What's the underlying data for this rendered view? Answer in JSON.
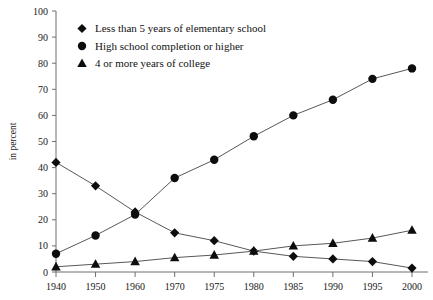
{
  "chart_data": {
    "type": "line",
    "title": "",
    "subtitle": "",
    "xlabel": "",
    "ylabel": "in percent",
    "x": [
      "1940",
      "1950",
      "1960",
      "1970",
      "1975",
      "1980",
      "1985",
      "1990",
      "1995",
      "2000"
    ],
    "categories": [
      "1940",
      "1950",
      "1960",
      "1970",
      "1975",
      "1980",
      "1985",
      "1990",
      "1995",
      "2000"
    ],
    "ylim": [
      0,
      100
    ],
    "yticks": [
      "0",
      "10",
      "20",
      "30",
      "40",
      "50",
      "60",
      "70",
      "80",
      "90",
      "100"
    ],
    "grid": false,
    "legend_position": "top-center",
    "series": [
      {
        "name": "Less than 5 years of elementary school",
        "marker": "diamond",
        "values": [
          42,
          33,
          23,
          15,
          12,
          8,
          6,
          5,
          4,
          1.5
        ]
      },
      {
        "name": "High school completion or higher",
        "marker": "circle",
        "values": [
          7,
          14,
          22,
          36,
          43,
          52,
          60,
          66,
          74,
          78
        ]
      },
      {
        "name": "4 or more years of college",
        "marker": "triangle",
        "values": [
          2,
          3,
          4,
          5.5,
          6.5,
          8,
          10,
          11,
          13,
          16
        ]
      }
    ],
    "colors": {
      "marker": "#0d0d0d",
      "line": "#58585a",
      "axis": "#6f6f6f",
      "text": "#111111",
      "background": "#ffffff"
    }
  }
}
